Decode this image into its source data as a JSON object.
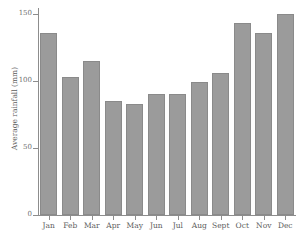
{
  "chart_data": {
    "type": "bar",
    "title": "",
    "xlabel": "",
    "ylabel": "Average rainfall (mm)",
    "categories": [
      "Jan",
      "Feb",
      "Mar",
      "Apr",
      "May",
      "Jun",
      "Jul",
      "Aug",
      "Sept",
      "Oct",
      "Nov",
      "Dec"
    ],
    "values": [
      136,
      103,
      115,
      85,
      83,
      90,
      90,
      99,
      106,
      143,
      136,
      150
    ],
    "ylim": [
      0,
      150
    ],
    "yticks": [
      0,
      50,
      100,
      150
    ],
    "ytick_labels": [
      "0",
      "50",
      "100",
      "150"
    ],
    "grid": false,
    "legend": false,
    "bar_color": "#9b9b9b",
    "bar_edge_color": "#8a8a8a",
    "axis_color": "#8d8d8d",
    "background": "#ffffff"
  }
}
